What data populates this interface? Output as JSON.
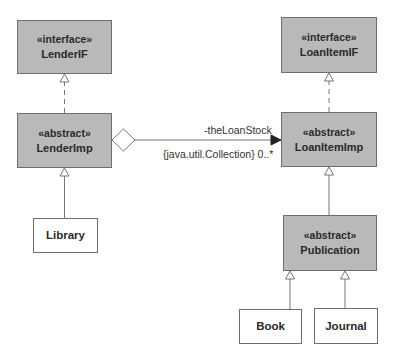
{
  "diagram": {
    "type": "UML class diagram",
    "classes": [
      {
        "id": "lenderif",
        "stereotype": "«interface»",
        "name": "LenderIF",
        "kind": "interface"
      },
      {
        "id": "lenderimp",
        "stereotype": "«abstract»",
        "name": "LenderImp",
        "kind": "abstract"
      },
      {
        "id": "library",
        "stereotype": "",
        "name": "Library",
        "kind": "concrete"
      },
      {
        "id": "loanitemif",
        "stereotype": "«interface»",
        "name": "LoanItemIF",
        "kind": "interface"
      },
      {
        "id": "loanitemimp",
        "stereotype": "«abstract»",
        "name": "LoanItemImp",
        "kind": "abstract"
      },
      {
        "id": "publication",
        "stereotype": "«abstract»",
        "name": "Publication",
        "kind": "abstract"
      },
      {
        "id": "book",
        "stereotype": "",
        "name": "Book",
        "kind": "concrete"
      },
      {
        "id": "journal",
        "stereotype": "",
        "name": "Journal",
        "kind": "concrete"
      }
    ],
    "relationships": [
      {
        "type": "realization",
        "from": "LenderImp",
        "to": "LenderIF"
      },
      {
        "type": "generalization",
        "from": "Library",
        "to": "LenderImp"
      },
      {
        "type": "aggregation",
        "from": "LenderImp",
        "to": "LoanItemImp",
        "role": "-theLoanStock",
        "constraint": "{java.util.Collection} 0..*"
      },
      {
        "type": "realization",
        "from": "LoanItemImp",
        "to": "LoanItemIF"
      },
      {
        "type": "generalization",
        "from": "Publication",
        "to": "LoanItemImp"
      },
      {
        "type": "generalization",
        "from": "Book",
        "to": "Publication"
      },
      {
        "type": "generalization",
        "from": "Journal",
        "to": "Publication"
      }
    ],
    "association_labels": {
      "role": "-theLoanStock",
      "constraint": "{java.util.Collection} 0..*"
    },
    "colors": {
      "abstract_fill": "#b9b9b9",
      "concrete_fill": "#ffffff",
      "stroke": "#6e6e6e",
      "text": "#2a2a2a"
    }
  }
}
